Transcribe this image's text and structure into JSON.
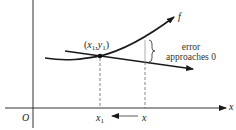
{
  "diagram": {
    "axes": {
      "x_label": "x",
      "origin_label": "O"
    },
    "curve": {
      "label": "f",
      "color": "#1a1a1a"
    },
    "point": {
      "label_x": "x",
      "label_x_sub": "1",
      "label_y": "y",
      "label_y_sub": "1",
      "label_open": "(",
      "label_comma": ",",
      "label_close": ")"
    },
    "x_ticks": {
      "x1_main": "x",
      "x1_sub": "1",
      "x_main": "x",
      "arrow": "←"
    },
    "error_annotation": {
      "line1": "error",
      "line2": "approaches 0"
    }
  }
}
